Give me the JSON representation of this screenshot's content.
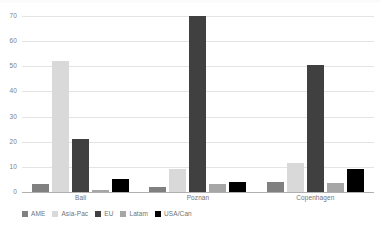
{
  "chart_data": {
    "type": "bar",
    "title": "",
    "subtitle": "",
    "xlabel": "",
    "ylabel": "",
    "ylim": [
      0,
      70
    ],
    "yticks": [
      0,
      10,
      20,
      30,
      40,
      50,
      60,
      70
    ],
    "ytick_labels": [
      "0",
      "10",
      "20",
      "30",
      "40",
      "50",
      "60",
      "70"
    ],
    "grid": true,
    "legend_position": "bottom-left",
    "categories": [
      "Bali",
      "Poznan",
      "Copenhagen"
    ],
    "series": [
      {
        "name": "AME",
        "color": "#808080",
        "values": [
          3,
          2,
          4
        ]
      },
      {
        "name": "Asia-Pac",
        "color": "#d9d9d9",
        "values": [
          52,
          9,
          11.5
        ]
      },
      {
        "name": "EU",
        "color": "#404040",
        "values": [
          21,
          70,
          50.5
        ]
      },
      {
        "name": "Latam",
        "color": "#a6a6a6",
        "values": [
          1,
          3,
          3.5
        ]
      },
      {
        "name": "USA/Can",
        "color": "#000000",
        "values": [
          5,
          4,
          9
        ]
      }
    ]
  },
  "colors": {
    "background": "#ffffff",
    "gridline": "#e4e4e4",
    "axis": "#b0b0b0",
    "tick_text": "#808080",
    "label_text": "#737373"
  }
}
